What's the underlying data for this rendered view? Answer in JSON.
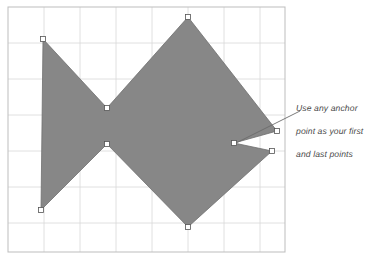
{
  "canvas": {
    "background_color": "#ffffff",
    "border_color": "#bdbdbd",
    "grid_color": "#d8d8d8",
    "grid_minor_color": "#e8e8e8",
    "bounds": {
      "x": 8,
      "y": 7,
      "width": 277,
      "height": 245
    },
    "grid_spacing": 36
  },
  "shape": {
    "name": "fish-polygon",
    "fill_color": "#878787",
    "stroke_color": "#6e6e6e",
    "points": [
      {
        "label": "anchor-top-left",
        "x": 43,
        "y": 39
      },
      {
        "label": "anchor-center-upper",
        "x": 107,
        "y": 108
      },
      {
        "label": "anchor-top-apex",
        "x": 188,
        "y": 17
      },
      {
        "label": "anchor-right-upper-tip",
        "x": 277,
        "y": 131
      },
      {
        "label": "anchor-notch",
        "x": 234,
        "y": 143
      },
      {
        "label": "anchor-right-lower-tip",
        "x": 272,
        "y": 151
      },
      {
        "label": "anchor-bottom-apex",
        "x": 188,
        "y": 227
      },
      {
        "label": "anchor-center-lower",
        "x": 107,
        "y": 144
      },
      {
        "label": "anchor-bottom-left",
        "x": 41,
        "y": 210
      }
    ],
    "anchor_fill": "#ffffff",
    "anchor_stroke": "#555555",
    "anchor_size": 5
  },
  "annotation": {
    "line1": "Use any anchor",
    "line2": "point as your first",
    "line3": "and last points",
    "text_color": "#4a4a4a",
    "leader_color": "#6b6b6b",
    "leader": {
      "x1": 300,
      "y1": 111,
      "x2": 236,
      "y2": 143
    }
  }
}
